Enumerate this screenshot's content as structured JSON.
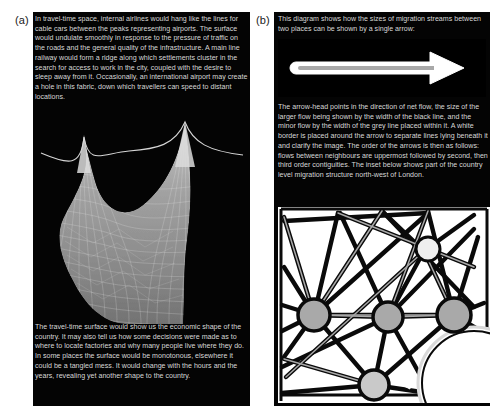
{
  "figure": {
    "background_color": "#ffffff",
    "panel_background_color": "#040404",
    "caption_text_color": "#d8d8d8",
    "accent_grey": "#9b9b9b",
    "inset_background_color": "#ffffff"
  },
  "panel_a": {
    "label": "(a)",
    "caption_top": "In travel-time space, internal airlines would hang like the lines for cable cars between the peaks representing airports. The surface would undulate smoothly in response to the pressure of traffic on the roads and the general quality of the infrastructure. A main line railway would form a ridge along which settlements cluster in the search for access to work in the city, coupled with the desire to sleep away from it. Occasionally, an international airport may create a hole in this fabric, down which travellers can speed to distant locations.",
    "caption_bottom": "The travel-time surface would show us the economic shape of the country. It may also tell us how some decisions were made as to where to locate factories and why many people live where they do. In some places the surface would be monotonous, elsewhere it could be a tangled mess. It would change with the hours and the years, revealing yet another shape to the country.",
    "artwork_name": "travel-time-surface-mesh"
  },
  "panel_b": {
    "label": "(b)",
    "caption_top": "This diagram shows how the sizes of migration streams between two places can be shown by a single arrow:",
    "caption_middle": "The arrow-head points in the direction of net flow, the size of the larger flow being shown by the width of the black line, and the minor flow by the width of the grey line placed within it. A white border is placed around the arrow to separate lines lying beneath it and clarify the image. The order of the arrows is then as follows: flows between neighbours are uppermost followed by second, then third order contiguities. The inset below shows part of the country level migration structure north-west of London.",
    "arrow_name": "migration-flow-arrow",
    "inset_name": "migration-network-inset"
  }
}
